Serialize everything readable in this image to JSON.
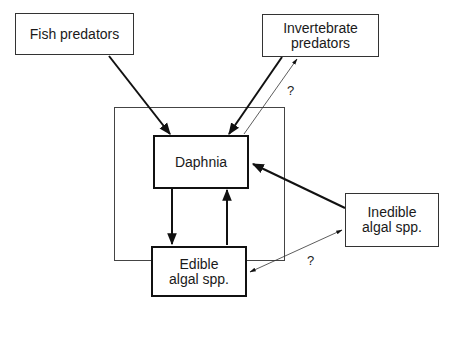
{
  "nodes": {
    "fish_predators": {
      "label": "Fish predators"
    },
    "invertebrate_predators": {
      "label": "Invertebrate\npredators"
    },
    "daphnia": {
      "label": "Daphnia"
    },
    "edible_algae": {
      "label": "Edible\nalgal spp."
    },
    "inedible_algae": {
      "label": "Inedible\nalgal spp."
    }
  },
  "annotations": {
    "q_invertebrate": "?",
    "q_algae": "?"
  },
  "edges": [
    {
      "from": "fish_predators",
      "to": "daphnia",
      "style": "thick"
    },
    {
      "from": "invertebrate_predators",
      "to": "daphnia",
      "style": "thick"
    },
    {
      "from": "daphnia",
      "to": "invertebrate_predators",
      "style": "thin",
      "label": "?"
    },
    {
      "from": "daphnia",
      "to": "edible_algae",
      "style": "thick"
    },
    {
      "from": "edible_algae",
      "to": "daphnia",
      "style": "thick"
    },
    {
      "from": "inedible_algae",
      "to": "daphnia",
      "style": "thick"
    },
    {
      "from": "edible_algae",
      "to": "inedible_algae",
      "style": "thin",
      "bidirectional": true,
      "label": "?"
    }
  ]
}
